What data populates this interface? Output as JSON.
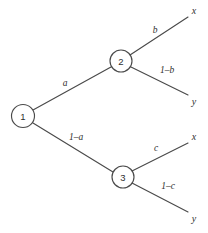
{
  "diagram": {
    "type": "probability-tree",
    "title": "",
    "background_color": "#ffffff",
    "line_color": "#4a4a4a",
    "text_color": "#2f2f2f",
    "nodes": [
      {
        "id": "node-1",
        "label": "1",
        "cx": 23,
        "cy": 116,
        "r": 11.5
      },
      {
        "id": "node-2",
        "label": "2",
        "cx": 121,
        "cy": 61,
        "r": 11
      },
      {
        "id": "node-3",
        "label": "3",
        "cx": 123,
        "cy": 177,
        "r": 11
      }
    ],
    "edges": [
      {
        "id": "edge-1-2",
        "label": "a",
        "from": "node-1",
        "to": "node-2",
        "x1": 33,
        "y1": 110,
        "x2": 111,
        "y2": 67,
        "label_x": 65,
        "label_y": 83
      },
      {
        "id": "edge-1-3",
        "label": "1–a",
        "from": "node-1",
        "to": "node-3",
        "x1": 33,
        "y1": 123,
        "x2": 113,
        "y2": 172,
        "label_x": 76,
        "label_y": 137
      },
      {
        "id": "edge-2-x",
        "label": "b",
        "from": "node-2",
        "to": "outcome-x-top",
        "x1": 130,
        "y1": 55,
        "x2": 188,
        "y2": 17,
        "label_x": 155,
        "label_y": 30
      },
      {
        "id": "edge-2-y",
        "label": "1–b",
        "from": "node-2",
        "to": "outcome-y-top",
        "x1": 131,
        "y1": 67,
        "x2": 188,
        "y2": 95,
        "label_x": 167,
        "label_y": 70
      },
      {
        "id": "edge-3-x",
        "label": "c",
        "from": "node-3",
        "to": "outcome-x-bottom",
        "x1": 132,
        "y1": 171,
        "x2": 188,
        "y2": 143,
        "label_x": 156,
        "label_y": 148
      },
      {
        "id": "edge-3-y",
        "label": "1–c",
        "from": "node-3",
        "to": "outcome-y-bottom",
        "x1": 132,
        "y1": 183,
        "x2": 188,
        "y2": 212,
        "label_x": 168,
        "label_y": 186
      }
    ],
    "outcomes": [
      {
        "id": "outcome-x-top",
        "label": "x",
        "x": 194,
        "y": 10
      },
      {
        "id": "outcome-y-top",
        "label": "y",
        "x": 194,
        "y": 101
      },
      {
        "id": "outcome-x-bottom",
        "label": "x",
        "x": 194,
        "y": 136
      },
      {
        "id": "outcome-y-bottom",
        "label": "y",
        "x": 194,
        "y": 218
      }
    ]
  }
}
